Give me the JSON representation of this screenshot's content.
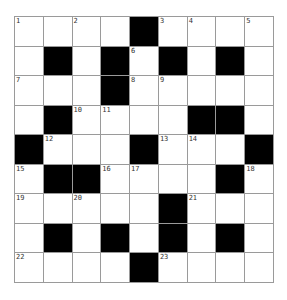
{
  "puzzle": {
    "rows": 9,
    "cols": 9,
    "colors": {
      "block": "#000000",
      "cell": "#ffffff",
      "gridline": "#9a9a9a",
      "number": "#333333"
    },
    "layout": [
      "1.2.#34.5",
      ".#.#6#.#.",
      "7..#89...",
      ".#AB..##.",
      "#C..#DE.#",
      "F##GH..#I",
      "J.K..#L..",
      ".#.#.#.#.",
      "M...#N..."
    ],
    "cells": [
      [
        {
          "n": "1"
        },
        {
          "n": ""
        },
        {
          "n": "2"
        },
        {
          "n": ""
        },
        {
          "b": true
        },
        {
          "n": "3"
        },
        {
          "n": "4"
        },
        {
          "n": ""
        },
        {
          "n": "5"
        }
      ],
      [
        {
          "n": ""
        },
        {
          "b": true
        },
        {
          "n": ""
        },
        {
          "b": true
        },
        {
          "n": "6"
        },
        {
          "b": true
        },
        {
          "n": ""
        },
        {
          "b": true
        },
        {
          "n": ""
        }
      ],
      [
        {
          "n": "7"
        },
        {
          "n": ""
        },
        {
          "n": ""
        },
        {
          "b": true
        },
        {
          "n": "8"
        },
        {
          "n": "9"
        },
        {
          "n": ""
        },
        {
          "n": ""
        },
        {
          "n": ""
        }
      ],
      [
        {
          "n": ""
        },
        {
          "b": true
        },
        {
          "n": "10"
        },
        {
          "n": "11"
        },
        {
          "n": ""
        },
        {
          "n": ""
        },
        {
          "b": true
        },
        {
          "b": true
        },
        {
          "n": ""
        }
      ],
      [
        {
          "b": true
        },
        {
          "n": "12"
        },
        {
          "n": ""
        },
        {
          "n": ""
        },
        {
          "b": true
        },
        {
          "n": "13"
        },
        {
          "n": "14"
        },
        {
          "n": ""
        },
        {
          "b": true
        }
      ],
      [
        {
          "n": "15"
        },
        {
          "b": true
        },
        {
          "b": true
        },
        {
          "n": "16"
        },
        {
          "n": "17"
        },
        {
          "n": ""
        },
        {
          "n": ""
        },
        {
          "b": true
        },
        {
          "n": "18"
        }
      ],
      [
        {
          "n": "19"
        },
        {
          "n": ""
        },
        {
          "n": "20"
        },
        {
          "n": ""
        },
        {
          "n": ""
        },
        {
          "b": true
        },
        {
          "n": "21"
        },
        {
          "n": ""
        },
        {
          "n": ""
        }
      ],
      [
        {
          "n": ""
        },
        {
          "b": true
        },
        {
          "n": ""
        },
        {
          "b": true
        },
        {
          "n": ""
        },
        {
          "b": true
        },
        {
          "n": ""
        },
        {
          "b": true
        },
        {
          "n": ""
        }
      ],
      [
        {
          "n": "22"
        },
        {
          "n": ""
        },
        {
          "n": ""
        },
        {
          "n": ""
        },
        {
          "b": true
        },
        {
          "n": "23"
        },
        {
          "n": ""
        },
        {
          "n": ""
        },
        {
          "n": ""
        }
      ]
    ]
  }
}
